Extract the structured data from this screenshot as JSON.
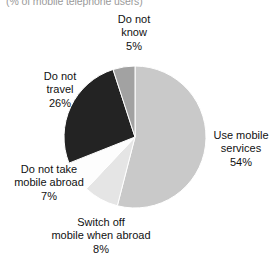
{
  "subtitle": "(% of mobile telephone users)",
  "chart_data": {
    "type": "pie",
    "title": "",
    "subtitle": "(% of mobile telephone users)",
    "xlabel": "",
    "ylabel": "",
    "grid": false,
    "legend_position": "none",
    "labels_position": "outside-callout",
    "start_angle_deg": 0,
    "direction": "clockwise",
    "total": 100,
    "unit": "%",
    "slices": [
      {
        "name": "Use mobile services",
        "label_line1": "Use mobile",
        "label_line2": "services",
        "value": 54,
        "pct_label": "54%",
        "color": "#c9c9c9",
        "label_anchor": "right"
      },
      {
        "name": "Switch off mobile when abroad",
        "label_line1": "Switch off",
        "label_line2": "mobile when abroad",
        "value": 8,
        "pct_label": "8%",
        "color": "#e5e5e5",
        "label_anchor": "bottom"
      },
      {
        "name": "Do not take mobile abroad",
        "label_line1": "Do not take",
        "label_line2": "mobile abroad",
        "value": 7,
        "pct_label": "7%",
        "color": "#fdfdfd",
        "label_anchor": "bottom-left"
      },
      {
        "name": "Do not travel",
        "label_line1": "Do not",
        "label_line2": "travel",
        "value": 26,
        "pct_label": "26%",
        "color": "#232323",
        "label_anchor": "top-left"
      },
      {
        "name": "Do not know",
        "label_line1": "Do not",
        "label_line2": "know",
        "value": 5,
        "pct_label": "5%",
        "color": "#a2a2a2",
        "label_anchor": "top"
      }
    ]
  }
}
